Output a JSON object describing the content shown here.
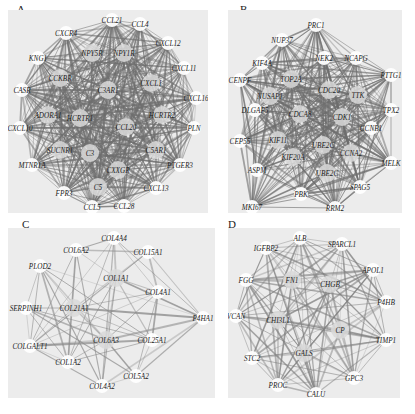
{
  "figure": {
    "panels": [
      {
        "letter": "A",
        "box": {
          "x": 8,
          "y": 10,
          "w": 200,
          "h": 203
        },
        "letter_pos": {
          "x": 17,
          "y": 3
        },
        "edge_color": "#6e6e6e",
        "edge_density": "very-high",
        "nodes": [
          {
            "id": "CCL21",
            "x": 104,
            "y": 10,
            "outer": true
          },
          {
            "id": "CCL4",
            "x": 132,
            "y": 14,
            "outer": true
          },
          {
            "id": "CXCR4",
            "x": 58,
            "y": 23,
            "outer": true
          },
          {
            "id": "CXCL12",
            "x": 160,
            "y": 33,
            "outer": true
          },
          {
            "id": "KNG1",
            "x": 30,
            "y": 48,
            "outer": true
          },
          {
            "id": "CXCL11",
            "x": 176,
            "y": 58,
            "outer": true
          },
          {
            "id": "CASR",
            "x": 14,
            "y": 80,
            "outer": true
          },
          {
            "id": "CXCL16",
            "x": 188,
            "y": 88,
            "outer": true
          },
          {
            "id": "CXCL10",
            "x": 12,
            "y": 118,
            "outer": true
          },
          {
            "id": "PLN",
            "x": 186,
            "y": 118,
            "outer": true
          },
          {
            "id": "MTNR1A",
            "x": 24,
            "y": 155,
            "outer": true
          },
          {
            "id": "PTGER3",
            "x": 172,
            "y": 155,
            "outer": true
          },
          {
            "id": "FPR3",
            "x": 56,
            "y": 183,
            "outer": true
          },
          {
            "id": "CXCL13",
            "x": 148,
            "y": 178,
            "outer": true
          },
          {
            "id": "CCL5",
            "x": 84,
            "y": 197,
            "outer": true
          },
          {
            "id": "CCL28",
            "x": 116,
            "y": 196,
            "outer": true
          },
          {
            "id": "NPY5R",
            "x": 84,
            "y": 43,
            "outer": false
          },
          {
            "id": "NPY1R",
            "x": 116,
            "y": 43,
            "outer": false
          },
          {
            "id": "CCKBR",
            "x": 52,
            "y": 68,
            "outer": false
          },
          {
            "id": "C3AR1",
            "x": 100,
            "y": 80,
            "outer": false
          },
          {
            "id": "CXCL1",
            "x": 143,
            "y": 73,
            "outer": false
          },
          {
            "id": "ADORA1",
            "x": 40,
            "y": 105,
            "outer": false
          },
          {
            "id": "HCRTR1",
            "x": 72,
            "y": 108,
            "outer": false
          },
          {
            "id": "HCRTR2",
            "x": 154,
            "y": 105,
            "outer": false
          },
          {
            "id": "CCL20",
            "x": 118,
            "y": 117,
            "outer": false
          },
          {
            "id": "SUCNR1",
            "x": 52,
            "y": 140,
            "outer": false
          },
          {
            "id": "C3",
            "x": 82,
            "y": 143,
            "outer": false
          },
          {
            "id": "C5AR1",
            "x": 148,
            "y": 140,
            "outer": false
          },
          {
            "id": "CXXGR",
            "x": 110,
            "y": 160,
            "outer": false
          },
          {
            "id": "C5",
            "x": 90,
            "y": 177,
            "outer": false
          }
        ],
        "label_overrides": {
          "CXXGR": "CXXGR",
          "HCRTR1": "HCRTR1",
          "HCRTR2": "HCRTR2"
        }
      },
      {
        "letter": "B",
        "box": {
          "x": 228,
          "y": 10,
          "w": 174,
          "h": 203
        },
        "letter_pos": {
          "x": 240,
          "y": 3
        },
        "edge_color": "#6e6e6e",
        "edge_density": "high",
        "nodes": [
          {
            "id": "PRC1",
            "x": 88,
            "y": 15,
            "outer": true
          },
          {
            "id": "NUP37",
            "x": 54,
            "y": 30,
            "outer": true
          },
          {
            "id": "NEK2",
            "x": 96,
            "y": 48,
            "outer": true
          },
          {
            "id": "NCAPG",
            "x": 128,
            "y": 48,
            "outer": true
          },
          {
            "id": "KIF4A",
            "x": 34,
            "y": 53,
            "outer": true
          },
          {
            "id": "PTTG1",
            "x": 163,
            "y": 65,
            "outer": true
          },
          {
            "id": "CENPF",
            "x": 12,
            "y": 70,
            "outer": true
          },
          {
            "id": "TOP2A",
            "x": 63,
            "y": 69,
            "outer": false
          },
          {
            "id": "NUSAP1",
            "x": 42,
            "y": 86,
            "outer": false
          },
          {
            "id": "CDC20",
            "x": 101,
            "y": 80,
            "outer": false
          },
          {
            "id": "TTK",
            "x": 130,
            "y": 85,
            "outer": false
          },
          {
            "id": "DLGAP5",
            "x": 27,
            "y": 100,
            "outer": true
          },
          {
            "id": "TPX2",
            "x": 163,
            "y": 100,
            "outer": true
          },
          {
            "id": "CDCA8",
            "x": 72,
            "y": 104,
            "outer": false
          },
          {
            "id": "CDK1",
            "x": 114,
            "y": 107,
            "outer": false
          },
          {
            "id": "CCNB1",
            "x": 143,
            "y": 118,
            "outer": true
          },
          {
            "id": "CEP55",
            "x": 12,
            "y": 131,
            "outer": true
          },
          {
            "id": "KIF11",
            "x": 50,
            "y": 130,
            "outer": false
          },
          {
            "id": "CCNB1",
            "x": 95,
            "y": 135,
            "outer": false,
            "label": "UBE2C"
          },
          {
            "id": "CCNA2",
            "x": 123,
            "y": 143,
            "outer": false
          },
          {
            "id": "MELK",
            "x": 163,
            "y": 153,
            "outer": true
          },
          {
            "id": "KIF20A",
            "x": 65,
            "y": 147,
            "outer": false
          },
          {
            "id": "ASPM",
            "x": 29,
            "y": 160,
            "outer": true
          },
          {
            "id": "UBE2C",
            "x": 99,
            "y": 163,
            "outer": false,
            "label": "UBE2C"
          },
          {
            "id": "SPAG5",
            "x": 132,
            "y": 177,
            "outer": true
          },
          {
            "id": "PBK",
            "x": 73,
            "y": 184,
            "outer": true
          },
          {
            "id": "MKI67",
            "x": 24,
            "y": 197,
            "outer": true
          },
          {
            "id": "RRM2",
            "x": 107,
            "y": 198,
            "outer": true
          }
        ]
      },
      {
        "letter": "C",
        "box": {
          "x": 8,
          "y": 228,
          "w": 207,
          "h": 170
        },
        "letter_pos": {
          "x": 22,
          "y": 218
        },
        "edge_color": "#8a8a8a",
        "edge_density": "medium",
        "nodes": [
          {
            "id": "COL4A4",
            "x": 106,
            "y": 10,
            "outer": true
          },
          {
            "id": "COL6A2",
            "x": 68,
            "y": 22,
            "outer": true
          },
          {
            "id": "COL15A1",
            "x": 140,
            "y": 24,
            "outer": true
          },
          {
            "id": "PLOD2",
            "x": 32,
            "y": 38,
            "outer": true
          },
          {
            "id": "COL1A1",
            "x": 108,
            "y": 50,
            "outer": false
          },
          {
            "id": "COL4A1",
            "x": 150,
            "y": 64,
            "outer": true
          },
          {
            "id": "SERPINH1",
            "x": 18,
            "y": 80,
            "outer": true
          },
          {
            "id": "COL21A1",
            "x": 66,
            "y": 80,
            "outer": false
          },
          {
            "id": "P4HA1",
            "x": 195,
            "y": 90,
            "outer": true
          },
          {
            "id": "COL6A3",
            "x": 98,
            "y": 112,
            "outer": false
          },
          {
            "id": "COL25A1",
            "x": 144,
            "y": 112,
            "outer": true
          },
          {
            "id": "COLGALT1",
            "x": 22,
            "y": 118,
            "outer": true
          },
          {
            "id": "COL1A2",
            "x": 60,
            "y": 134,
            "outer": true
          },
          {
            "id": "COL5A2",
            "x": 128,
            "y": 148,
            "outer": true
          },
          {
            "id": "COL4A2",
            "x": 94,
            "y": 158,
            "outer": true
          }
        ]
      },
      {
        "letter": "D",
        "box": {
          "x": 228,
          "y": 228,
          "w": 172,
          "h": 170
        },
        "letter_pos": {
          "x": 228,
          "y": 218
        },
        "edge_color": "#808080",
        "edge_density": "medium-high",
        "nodes": [
          {
            "id": "ALB",
            "x": 72,
            "y": 10,
            "outer": true
          },
          {
            "id": "SPARCL1",
            "x": 114,
            "y": 16,
            "outer": true
          },
          {
            "id": "IGFBP2",
            "x": 38,
            "y": 20,
            "outer": true
          },
          {
            "id": "APOL1",
            "x": 145,
            "y": 42,
            "outer": true
          },
          {
            "id": "FGG",
            "x": 18,
            "y": 52,
            "outer": true
          },
          {
            "id": "FN1",
            "x": 64,
            "y": 52,
            "outer": false
          },
          {
            "id": "CHGB",
            "x": 102,
            "y": 56,
            "outer": false
          },
          {
            "id": "P4HB",
            "x": 158,
            "y": 74,
            "outer": true
          },
          {
            "id": "VCAN",
            "x": 8,
            "y": 88,
            "outer": true
          },
          {
            "id": "CHI3L1",
            "x": 50,
            "y": 92,
            "outer": false
          },
          {
            "id": "CP",
            "x": 112,
            "y": 102,
            "outer": false
          },
          {
            "id": "TIMP1",
            "x": 158,
            "y": 112,
            "outer": true
          },
          {
            "id": "STC2",
            "x": 24,
            "y": 130,
            "outer": true
          },
          {
            "id": "GALS",
            "x": 76,
            "y": 125,
            "outer": false
          },
          {
            "id": "GPC3",
            "x": 126,
            "y": 150,
            "outer": true
          },
          {
            "id": "PROC",
            "x": 50,
            "y": 157,
            "outer": true
          },
          {
            "id": "CALU",
            "x": 88,
            "y": 166,
            "outer": true
          }
        ]
      }
    ]
  },
  "labels": {
    "A": {
      "CCL21": "CCL21",
      "CCL4": "CCL4",
      "CXCR4": "CXCR4",
      "CXCL12": "CXCL12",
      "KNG1": "KNG1",
      "CXCL11": "CXCL11",
      "CASR": "CASR",
      "CXCL16": "CXCL16",
      "CXCL10": "CXCL10",
      "PLN": "PLN",
      "MTNR1A": "MTNR1A",
      "PTGER3": "PTGER3",
      "FPR3": "FPR3",
      "CXCL13": "CXCL13",
      "CCL5": "CCL5",
      "CCL28": "CCL28",
      "NPY5R": "NPY5R",
      "NPY1R": "NPY1R",
      "CCKBR": "CCKBR",
      "C3AR1": "C3AR1",
      "CXCL1": "CXCL1",
      "ADORA1": "ADORA1",
      "HCRTR1": "HCRTR1",
      "HCRTR2": "HCRTR2",
      "CCL20": "CCL20",
      "SUCNR1": "SUCNR1",
      "C3": "C3",
      "C5AR1": "C5AR1",
      "CXXGR": "CXXGR",
      "C5": "C5"
    }
  }
}
